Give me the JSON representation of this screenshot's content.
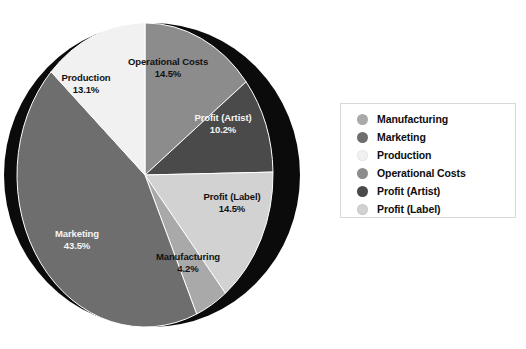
{
  "chart_data": {
    "type": "pie",
    "title": "",
    "labels": [
      "Manufacturing",
      "Marketing",
      "Production",
      "Operational Costs",
      "Profit (Artist)",
      "Profit (Label)"
    ],
    "values": [
      4.2,
      43.5,
      13.1,
      14.5,
      10.2,
      14.5
    ],
    "value_unit": "%",
    "legend_position": "right",
    "grid": false,
    "style": "3d-pie-with-side-shadow",
    "colors": {
      "Manufacturing": "#a9a9a9",
      "Marketing": "#6e6e6e",
      "Production": "#f1f1f1",
      "Operational Costs": "#8c8c8c",
      "Profit (Artist)": "#4a4a4a",
      "Profit (Label)": "#d2d2d2"
    },
    "slices": [
      {
        "name": "Operational Costs",
        "value": 14.5,
        "display_value": "14.5%",
        "color": "#8c8c8c",
        "start_deg": 0,
        "end_deg": 52.2,
        "label_x": 168,
        "label_y": 68
      },
      {
        "name": "Profit (Artist)",
        "value": 10.2,
        "display_value": "10.2%",
        "color": "#4a4a4a",
        "start_deg": 52.2,
        "end_deg": 88.9,
        "label_x": 223,
        "label_y": 124
      },
      {
        "name": "Profit (Label)",
        "value": 14.5,
        "display_value": "14.5%",
        "color": "#d2d2d2",
        "start_deg": 88.9,
        "end_deg": 141.1,
        "label_x": 232,
        "label_y": 203
      },
      {
        "name": "Manufacturing",
        "value": 4.2,
        "display_value": "4.2%",
        "color": "#a9a9a9",
        "start_deg": 141.1,
        "end_deg": 156.2,
        "label_x": 188,
        "label_y": 263
      },
      {
        "name": "Marketing",
        "value": 43.5,
        "display_value": "43.5%",
        "color": "#6e6e6e",
        "start_deg": 156.2,
        "end_deg": 312.8,
        "label_x": 77,
        "label_y": 240
      },
      {
        "name": "Production",
        "value": 13.1,
        "display_value": "13.1%",
        "color": "#f1f1f1",
        "start_deg": 312.8,
        "end_deg": 360,
        "label_x": 86,
        "label_y": 84
      }
    ]
  },
  "legend": {
    "items": [
      {
        "label": "Manufacturing",
        "color": "#a9a9a9"
      },
      {
        "label": "Marketing",
        "color": "#6e6e6e"
      },
      {
        "label": "Production",
        "color": "#f1f1f1"
      },
      {
        "label": "Operational Costs",
        "color": "#8c8c8c"
      },
      {
        "label": "Profit (Artist)",
        "color": "#4a4a4a"
      },
      {
        "label": "Profit (Label)",
        "color": "#d2d2d2"
      }
    ]
  }
}
